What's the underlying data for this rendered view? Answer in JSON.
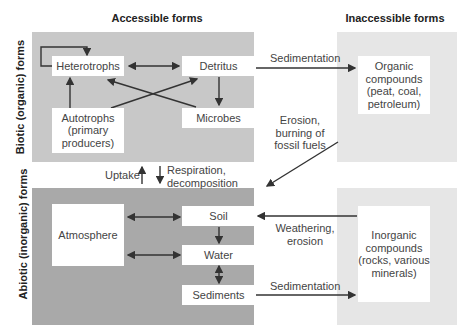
{
  "headers": {
    "accessible": "Accessible forms",
    "inaccessible": "Inaccessible forms"
  },
  "row_labels": {
    "biotic": "Biotic (organic) forms",
    "abiotic": "Abiotic (inorganic) forms"
  },
  "colors": {
    "biotic_panel": "#c8c8c8",
    "abiotic_panel": "#a9a9a9",
    "inaccessible_panel": "#e6e6e6",
    "box": "#ffffff",
    "arrow": "#333333"
  },
  "nodes": {
    "heterotrophs": "Heterotrophs",
    "detritus": "Detritus",
    "autotrophs": [
      "Autotrophs",
      "(primary",
      "producers)"
    ],
    "microbes": "Microbes",
    "organic": [
      "Organic",
      "compounds",
      "(peat, coal,",
      "petroleum)"
    ],
    "atmosphere": "Atmosphere",
    "soil": "Soil",
    "water": "Water",
    "sediments": "Sediments",
    "inorganic": [
      "Inorganic",
      "compounds",
      "(rocks, various",
      "minerals)"
    ]
  },
  "edge_labels": {
    "sedimentation_top": "Sedimentation",
    "erosion": [
      "Erosion,",
      "burning of",
      "fossil fuels"
    ],
    "uptake": "Uptake",
    "respiration": [
      "Respiration,",
      "decomposition"
    ],
    "weathering": [
      "Weathering,",
      "erosion"
    ],
    "sedimentation_bottom": "Sedimentation"
  }
}
